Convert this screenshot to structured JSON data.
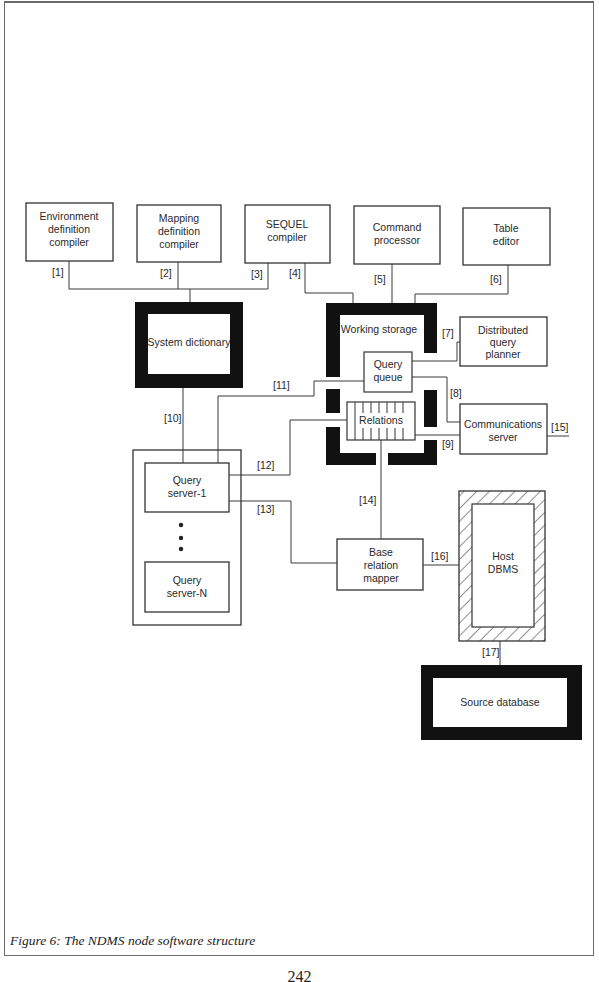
{
  "figure": {
    "caption": "Figure 6: The NDMS node software structure",
    "page_number": "242"
  },
  "components": {
    "env_compiler": [
      "Environment",
      "definition",
      "compiler"
    ],
    "mapping_compiler": [
      "Mapping",
      "definition",
      "compiler"
    ],
    "sequel_compiler": [
      "SEQUEL",
      "compiler"
    ],
    "command_processor": [
      "Command",
      "processor"
    ],
    "table_editor": [
      "Table",
      "editor"
    ],
    "system_dictionary": [
      "System dictionary"
    ],
    "working_storage": [
      "Working storage"
    ],
    "distributed_query_planner": [
      "Distributed",
      "query",
      "planner"
    ],
    "query_queue": [
      "Query",
      "queue"
    ],
    "relations": [
      "Relations"
    ],
    "communications_server": [
      "Communications",
      "server"
    ],
    "query_server_1": [
      "Query",
      "server-1"
    ],
    "query_server_n": [
      "Query",
      "server-N"
    ],
    "base_relation_mapper": [
      "Base",
      "relation",
      "mapper"
    ],
    "host_dbms": [
      "Host",
      "DBMS"
    ],
    "source_database": [
      "Source database"
    ]
  },
  "connections": {
    "c1": "[1]",
    "c2": "[2]",
    "c3": "[3]",
    "c4": "[4]",
    "c5": "[5]",
    "c6": "[6]",
    "c7": "[7]",
    "c8": "[8]",
    "c9": "[9]",
    "c10": "[10]",
    "c11": "[11]",
    "c12": "[12]",
    "c13": "[13]",
    "c14": "[14]",
    "c15": "[15]",
    "c16": "[16]",
    "c17": "[17]"
  },
  "colors": {
    "line": "#3a3a3a",
    "thick_border": "#111111",
    "background": "#ffffff"
  }
}
